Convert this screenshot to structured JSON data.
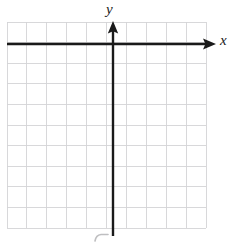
{
  "figure": {
    "type": "coordinate-grid",
    "width": 236,
    "height": 244,
    "background_color": "#ffffff"
  },
  "axes": {
    "x_label": "x",
    "y_label": "y",
    "axis_color": "#1a1a1a",
    "axis_stroke_width": 2.4,
    "x_axis_y": 44,
    "y_axis_x": 113,
    "x_axis_start": 7,
    "x_axis_end": 216,
    "y_axis_start": 21,
    "y_axis_end": 236,
    "arrowheads": [
      "x-positive",
      "y-positive"
    ]
  },
  "grid": {
    "color": "#d4d4d6",
    "stroke_width": 0.9,
    "left": 7,
    "top": 22,
    "right": 206,
    "bottom": 228,
    "columns": 10,
    "rows": 10,
    "cell_width": 19.9,
    "cell_height": 20.6,
    "vertical_line_x": [
      7,
      26.9,
      46.8,
      66.7,
      86.6,
      106.5,
      126.4,
      146.3,
      166.2,
      186.1,
      206
    ],
    "horizontal_line_y": [
      22,
      42.6,
      63.2,
      83.8,
      104.4,
      125,
      145.6,
      166.2,
      186.8,
      207.4,
      228
    ]
  },
  "artifacts": {
    "scan_mark": {
      "description": "faint curved scan mark below y-axis",
      "color": "#b8b8ba",
      "x": 95,
      "y": 234
    }
  }
}
